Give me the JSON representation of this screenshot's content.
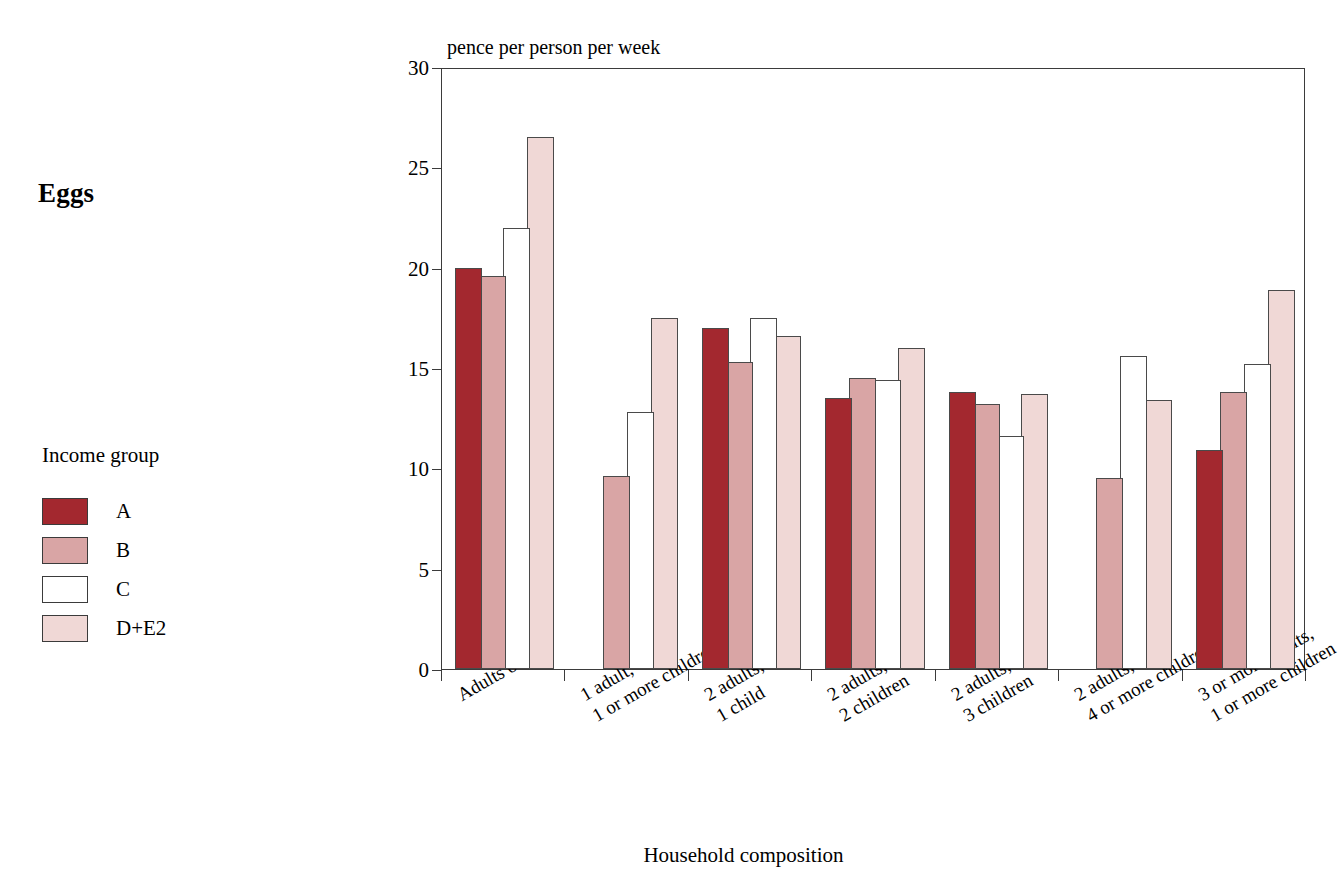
{
  "chart_title": "Eggs",
  "legend": {
    "title": "Income group",
    "items": [
      {
        "label": "A",
        "color": "#A3282F"
      },
      {
        "label": "B",
        "color": "#D9A5A5"
      },
      {
        "label": "C",
        "color": "#FFFFFF"
      },
      {
        "label": "D+E2",
        "color": "#F0D8D6"
      }
    ]
  },
  "chart_data": {
    "type": "bar",
    "title": "Eggs",
    "xlabel": "Household composition",
    "ylabel": "pence per person per week",
    "ylim": [
      0,
      30
    ],
    "yticks": [
      0,
      5,
      10,
      15,
      20,
      25,
      30
    ],
    "grid": true,
    "legend_position": "left",
    "categories": [
      "Adults only",
      "1 adult, 1 or more children",
      "2 adults, 1 child",
      "2 adults, 2 children",
      "2 adults, 3 children",
      "2 adults, 4 or more children",
      "3 or more adults, 1 or more children"
    ],
    "category_lines": [
      [
        "Adults only",
        ""
      ],
      [
        "1 adult,",
        "1 or more children"
      ],
      [
        "2 adults,",
        "1 child"
      ],
      [
        "2 adults,",
        "2 children"
      ],
      [
        "2 adults,",
        "3 children"
      ],
      [
        "2 adults,",
        "4 or more children"
      ],
      [
        "3 or more adults,",
        "1 or more children"
      ]
    ],
    "series": [
      {
        "name": "A",
        "color": "#A3282F",
        "values": [
          20.0,
          null,
          17.0,
          13.5,
          13.8,
          null,
          10.9
        ]
      },
      {
        "name": "B",
        "color": "#D9A5A5",
        "values": [
          19.6,
          9.6,
          15.3,
          14.5,
          13.2,
          9.5,
          13.8
        ]
      },
      {
        "name": "C",
        "color": "#FFFFFF",
        "values": [
          22.0,
          12.8,
          17.5,
          14.4,
          11.6,
          15.6,
          15.2
        ]
      },
      {
        "name": "D+E2",
        "color": "#F0D8D6",
        "values": [
          26.5,
          17.5,
          16.6,
          16.0,
          13.7,
          13.4,
          18.9
        ]
      }
    ]
  }
}
